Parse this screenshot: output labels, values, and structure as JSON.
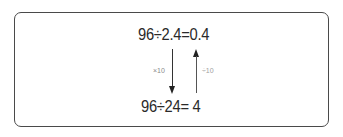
{
  "diagram": {
    "top_equation": "96÷2.4=0.4",
    "bottom_equation": "96÷24= 4",
    "down_arrow_label": "×10",
    "up_arrow_label": "÷10",
    "colors": {
      "border": "#4a4a4a",
      "text": "#2a2a2a",
      "label": "#8a8a8a",
      "arrow": "#222222"
    }
  }
}
